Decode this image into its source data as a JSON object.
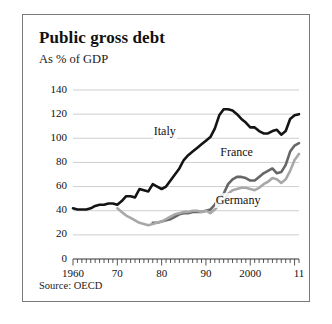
{
  "card": {
    "title": "Public gross debt",
    "subtitle": "As % of  GDP",
    "source": "Source: OECD"
  },
  "chart_data": {
    "type": "line",
    "title": "Public gross debt",
    "subtitle": "As % of  GDP",
    "xlabel": "",
    "ylabel": "",
    "source": "Source: OECD",
    "grid": true,
    "legend_position": "inline-labels",
    "xlim": [
      1960,
      2011
    ],
    "ylim": [
      0,
      140
    ],
    "yticks": [
      0,
      20,
      40,
      60,
      80,
      100,
      120,
      140
    ],
    "ytick_labels": [
      "0",
      "20",
      "40",
      "60",
      "80",
      "100",
      "120",
      "140"
    ],
    "xticks": [
      1960,
      1970,
      1980,
      1990,
      2000,
      2011
    ],
    "xtick_labels": [
      "1960",
      "70",
      "80",
      "90",
      "2000",
      "11"
    ],
    "minor_xtick_interval": 1,
    "colors": {
      "italy": "#141414",
      "france": "#666666",
      "germany": "#a8a8a8"
    },
    "series": [
      {
        "name": "Italy",
        "color": "#141414",
        "label_x": 1978,
        "label_y": 105,
        "x": [
          1960,
          1961,
          1962,
          1963,
          1964,
          1965,
          1966,
          1967,
          1968,
          1969,
          1970,
          1971,
          1972,
          1973,
          1974,
          1975,
          1976,
          1977,
          1978,
          1979,
          1980,
          1981,
          1982,
          1983,
          1984,
          1985,
          1986,
          1987,
          1988,
          1989,
          1990,
          1991,
          1992,
          1993,
          1994,
          1995,
          1996,
          1997,
          1998,
          1999,
          2000,
          2001,
          2002,
          2003,
          2004,
          2005,
          2006,
          2007,
          2008,
          2009,
          2010,
          2011
        ],
        "values": [
          42,
          41,
          41,
          41,
          42,
          44,
          45,
          45,
          46,
          46,
          45,
          48,
          52,
          52,
          51,
          58,
          57,
          56,
          62,
          60,
          58,
          60,
          65,
          70,
          75,
          82,
          86,
          89,
          92,
          95,
          98,
          101,
          108,
          119,
          124,
          124,
          123,
          120,
          116,
          113,
          109,
          109,
          106,
          104,
          104,
          106,
          107,
          103,
          106,
          116,
          119,
          120
        ]
      },
      {
        "name": "France",
        "color": "#666666",
        "label_x": 1993,
        "label_y": 88,
        "x": [
          1978,
          1979,
          1980,
          1981,
          1982,
          1983,
          1984,
          1985,
          1986,
          1987,
          1988,
          1989,
          1990,
          1991,
          1992,
          1993,
          1994,
          1995,
          1996,
          1997,
          1998,
          1999,
          2000,
          2001,
          2002,
          2003,
          2004,
          2005,
          2006,
          2007,
          2008,
          2009,
          2010,
          2011
        ],
        "values": [
          30,
          30,
          31,
          32,
          33,
          35,
          37,
          38,
          38,
          39,
          39,
          39,
          40,
          41,
          45,
          51,
          54,
          62,
          66,
          68,
          68,
          67,
          65,
          65,
          68,
          71,
          73,
          75,
          71,
          72,
          78,
          89,
          94,
          96
        ]
      },
      {
        "name": "Germany",
        "color": "#a8a8a8",
        "label_x": 1992,
        "label_y": 48,
        "x": [
          1970,
          1971,
          1972,
          1973,
          1974,
          1975,
          1976,
          1977,
          1978,
          1979,
          1980,
          1981,
          1982,
          1983,
          1984,
          1985,
          1986,
          1987,
          1988,
          1989,
          1990,
          1991,
          1992,
          1993,
          1994,
          1995,
          1996,
          1997,
          1998,
          1999,
          2000,
          2001,
          2002,
          2003,
          2004,
          2005,
          2006,
          2007,
          2008,
          2009,
          2010,
          2011
        ],
        "values": [
          42,
          39,
          36,
          34,
          32,
          30,
          29,
          28,
          29,
          30,
          31,
          33,
          35,
          37,
          38,
          39,
          39,
          40,
          40,
          39,
          40,
          38,
          41,
          45,
          47,
          54,
          57,
          58,
          59,
          59,
          58,
          57,
          59,
          62,
          64,
          67,
          66,
          63,
          66,
          73,
          82,
          87
        ]
      }
    ]
  },
  "axis": {
    "y_labels": [
      "140",
      "120",
      "100",
      "80",
      "60",
      "40",
      "20",
      "0"
    ],
    "x_labels": [
      "1960",
      "70",
      "80",
      "90",
      "2000",
      "11"
    ]
  }
}
